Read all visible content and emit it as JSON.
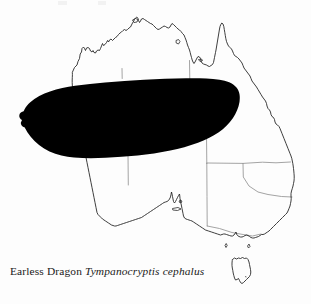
{
  "figure": {
    "type": "distribution-map",
    "region": "Australia",
    "caption": {
      "common_name": "Earless Dragon",
      "scientific_name": "Tympanocryptis cephalus"
    },
    "colors": {
      "background": "#fdfdfd",
      "coastline": "#1c1c1c",
      "state_border": "#8d8d8d",
      "range_fill": "#000000",
      "caption_text": "#1a1a1a"
    },
    "legend": {
      "range_meaning": "solid black shading indicates species distribution"
    }
  },
  "map": {
    "coastline_label": "Australian mainland coastline",
    "tasmania_label": "Tasmania",
    "islands_label": "offshore islands",
    "state_borders_label": "state and territory boundaries",
    "range_label": "Earless Dragon distribution range"
  }
}
